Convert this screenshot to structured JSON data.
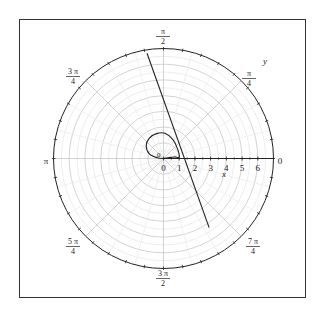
{
  "chart_data": {
    "type": "line",
    "coordinate_system": "polar",
    "title": "",
    "xlabel": "x",
    "ylabel": "y",
    "radial_range": [
      0,
      7
    ],
    "radial_ticks": [
      "0",
      "1",
      "2",
      "3",
      "4",
      "5",
      "6"
    ],
    "angular_labels": [
      {
        "angle": "0",
        "text": "0"
      },
      {
        "angle": "pi/4",
        "num": "π",
        "den": "4"
      },
      {
        "angle": "pi/2",
        "num": "π",
        "den": "2"
      },
      {
        "angle": "3pi/4",
        "num": "3 π",
        "den": "4"
      },
      {
        "angle": "pi",
        "text": "π"
      },
      {
        "angle": "5pi/4",
        "num": "5 π",
        "den": "4"
      },
      {
        "angle": "3pi/2",
        "num": "3 π",
        "den": "2"
      },
      {
        "angle": "7pi/4",
        "num": "7 π",
        "den": "4"
      }
    ],
    "grid": true,
    "series": [
      {
        "name": "loop-curve",
        "description": "small closed loop above origin with tail along positive x-axis",
        "points_xy": [
          [
            0,
            0
          ],
          [
            0.3,
            0.05
          ],
          [
            0.7,
            0.1
          ],
          [
            1.0,
            0.1
          ],
          [
            0.9,
            0.6
          ],
          [
            0.6,
            1.2
          ],
          [
            0.1,
            1.6
          ],
          [
            -0.4,
            1.6
          ],
          [
            -0.9,
            1.3
          ],
          [
            -1.1,
            0.8
          ],
          [
            -0.9,
            0.3
          ],
          [
            -0.4,
            0.05
          ],
          [
            0,
            0
          ]
        ]
      },
      {
        "name": "straight-line",
        "description": "line crossing the plot from near pi/2 edge down to the 7pi/4 quadrant",
        "points_xy": [
          [
            -1.05,
            6.7
          ],
          [
            2.9,
            -4.4
          ]
        ]
      }
    ]
  },
  "labels": {
    "x_axis": "x",
    "y_axis": "y",
    "origin_radial": "0"
  }
}
